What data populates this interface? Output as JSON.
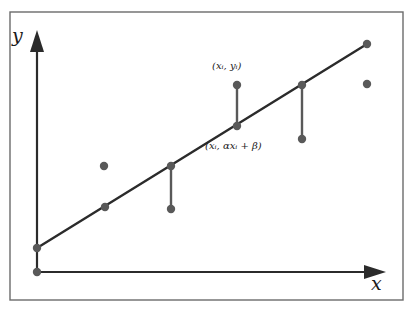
{
  "figure": {
    "frame": {
      "x": 10,
      "y": 12,
      "width": 393,
      "height": 288,
      "stroke": "#6b6b6b",
      "stroke_width": 1.4,
      "fill": "#ffffff"
    },
    "axes": {
      "origin": {
        "x": 37,
        "y": 272
      },
      "color": "#2b2b2b",
      "stroke_width": 2.2,
      "y_axis": {
        "x": 37,
        "y_top": 30,
        "y_bottom": 272,
        "label": "y"
      },
      "x_axis": {
        "y": 272,
        "x_left": 37,
        "x_right": 386,
        "label": "x"
      },
      "arrowhead": {
        "length": 22,
        "halfwidth": 7
      }
    }
  },
  "chart_data": {
    "type": "scatter",
    "title": "",
    "xlabel": "x",
    "ylabel": "y",
    "grid": false,
    "legend": null,
    "line_color": "#2b2b2b",
    "point_color": "#595959",
    "residual_color": "#595959",
    "point_radius": 4.2,
    "line_width": 2.4,
    "residual_width": 2.4,
    "regression_line": {
      "name": "alpha*x + beta",
      "x1": 37,
      "y1": 248,
      "x2": 367,
      "y2": 44
    },
    "fitted_points": [
      {
        "x": 37,
        "y": 248
      },
      {
        "x": 105,
        "y": 207
      },
      {
        "x": 171,
        "y": 166
      },
      {
        "x": 237,
        "y": 126
      },
      {
        "x": 302,
        "y": 85
      },
      {
        "x": 367,
        "y": 44
      }
    ],
    "observed_points": [
      {
        "x": 37,
        "y": 272,
        "note": "origin-marker"
      },
      {
        "x": 104,
        "y": 166,
        "note": "above-line"
      },
      {
        "x": 171,
        "y": 209,
        "note": "below-line"
      },
      {
        "x": 237,
        "y": 85,
        "note": "above-line-labelled"
      },
      {
        "x": 302,
        "y": 139,
        "note": "below-line"
      },
      {
        "x": 367,
        "y": 84,
        "note": "below-line-far-right"
      }
    ],
    "residual_segments": [
      {
        "x": 171,
        "y_top": 166,
        "y_bottom": 209
      },
      {
        "x": 237,
        "y_top": 85,
        "y_bottom": 126
      },
      {
        "x": 302,
        "y_top": 85,
        "y_bottom": 139
      }
    ],
    "annotations": [
      {
        "name": "observed-point-label",
        "text": "(xᵢ, yᵢ)",
        "x": 212,
        "y": 60
      },
      {
        "name": "fitted-point-label",
        "text": "(xᵢ, αxᵢ + β)",
        "x": 205,
        "y": 140
      }
    ]
  },
  "labels": {
    "y_axis": "y",
    "x_axis": "x",
    "observed_point": "(xᵢ, yᵢ)",
    "fitted_point": "(xᵢ, αxᵢ + β)"
  },
  "colors": {
    "frame": "#6b6b6b",
    "axis": "#2b2b2b",
    "line": "#2b2b2b",
    "point": "#595959",
    "residual": "#595959",
    "text": "#1a1a1a",
    "background": "#ffffff"
  }
}
